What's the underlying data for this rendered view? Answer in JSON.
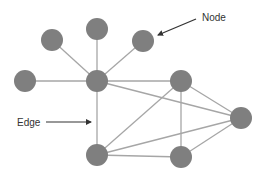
{
  "diagram": {
    "type": "network-graph",
    "colors": {
      "node_fill": "#7f7f7f",
      "edge_stroke": "#a6a6a6",
      "annotation_arrow": "#333333",
      "text": "#333333",
      "background": "#ffffff"
    },
    "node_radius": 11,
    "nodes": [
      {
        "id": "leaf-top-left",
        "x": 52,
        "y": 40
      },
      {
        "id": "leaf-top-center",
        "x": 97,
        "y": 29
      },
      {
        "id": "leaf-top-right",
        "x": 143,
        "y": 41
      },
      {
        "id": "leaf-left",
        "x": 25,
        "y": 81
      },
      {
        "id": "hub",
        "x": 97,
        "y": 81
      },
      {
        "id": "right-upper",
        "x": 181,
        "y": 81
      },
      {
        "id": "far-right",
        "x": 241,
        "y": 118
      },
      {
        "id": "bottom-left",
        "x": 97,
        "y": 155
      },
      {
        "id": "bottom-right",
        "x": 181,
        "y": 157
      }
    ],
    "edges": [
      [
        "hub",
        "leaf-top-left"
      ],
      [
        "hub",
        "leaf-top-center"
      ],
      [
        "hub",
        "leaf-top-right"
      ],
      [
        "hub",
        "leaf-left"
      ],
      [
        "hub",
        "right-upper"
      ],
      [
        "hub",
        "far-right"
      ],
      [
        "hub",
        "bottom-left"
      ],
      [
        "right-upper",
        "far-right"
      ],
      [
        "right-upper",
        "bottom-right"
      ],
      [
        "right-upper",
        "bottom-left"
      ],
      [
        "far-right",
        "bottom-left"
      ],
      [
        "far-right",
        "bottom-right"
      ],
      [
        "bottom-left",
        "bottom-right"
      ]
    ],
    "annotations": [
      {
        "id": "node-annotation",
        "text": "Node",
        "text_x": 202,
        "text_y": 21,
        "arrow_from": [
          196,
          19
        ],
        "arrow_to": [
          158,
          35
        ]
      },
      {
        "id": "edge-annotation",
        "text": "Edge",
        "text_x": 17,
        "text_y": 126,
        "arrow_from": [
          46,
          122
        ],
        "arrow_to": [
          91,
          122
        ]
      }
    ]
  }
}
